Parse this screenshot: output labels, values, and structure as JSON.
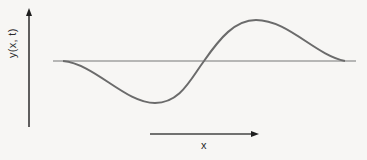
{
  "figure": {
    "y_axis_label": "y(x, t)",
    "x_axis_label": "x",
    "colors": {
      "background": "#f7f6f4",
      "axis": "#1e1e1e",
      "baseline": "#777777",
      "wave": "#6b6b6b"
    }
  }
}
